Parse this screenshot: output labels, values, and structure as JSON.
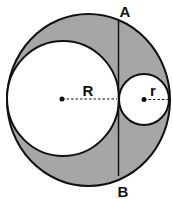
{
  "diagram": {
    "colors": {
      "shaded": "#a6a6a6",
      "stroke": "#111111",
      "fill_inner": "#ffffff"
    },
    "labels": {
      "point_a": "A",
      "point_b": "B",
      "big_radius": "R",
      "small_radius": "r"
    }
  }
}
